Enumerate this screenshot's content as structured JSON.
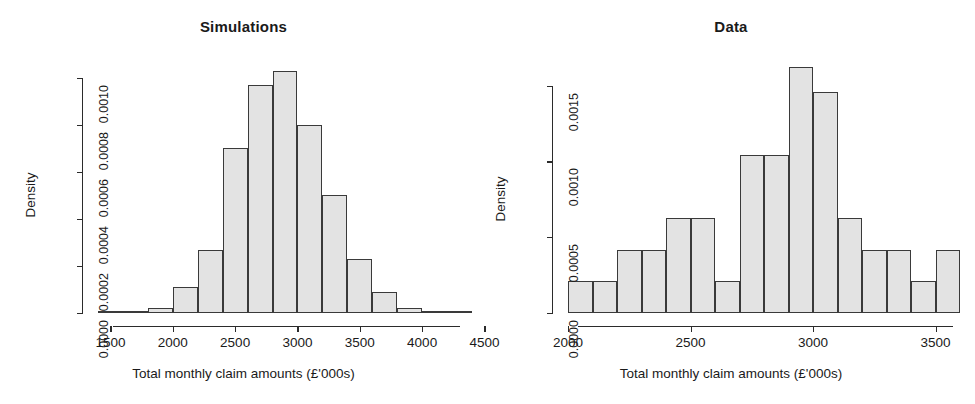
{
  "figure": {
    "background": "#ffffff",
    "bar_fill": "#e3e3e3",
    "bar_stroke": "#3a3a3a",
    "axis_color": "#2b2b2b"
  },
  "panels": [
    {
      "key": "simulations",
      "title": "Simulations",
      "xlabel": "Total monthly claim amounts (£'000s)",
      "ylabel": "Density",
      "xticks": [
        "1500",
        "2000",
        "2500",
        "3000",
        "3500",
        "4000",
        "4500"
      ],
      "yticks": [
        "0.0000",
        "0.0002",
        "0.0004",
        "0.0006",
        "0.0008",
        "0.0010"
      ]
    },
    {
      "key": "data",
      "title": "Data",
      "xlabel": "Total monthly claim amounts (£'000s)",
      "ylabel": "Density",
      "xticks": [
        "2000",
        "2500",
        "3000",
        "3500"
      ],
      "yticks": [
        "0.0000",
        "0.0005",
        "0.0010",
        "0.0015"
      ]
    }
  ],
  "chart_data": [
    {
      "type": "bar",
      "subtype": "histogram",
      "title": "Simulations",
      "xlabel": "Total monthly claim amounts (£'000s)",
      "ylabel": "Density",
      "xlim": [
        1400,
        4400
      ],
      "ylim": [
        0,
        0.00105
      ],
      "xticks": [
        1500,
        2000,
        2500,
        3000,
        3500,
        4000,
        4500
      ],
      "yticks": [
        0.0,
        0.0002,
        0.0004,
        0.0006,
        0.0008,
        0.001
      ],
      "grid": false,
      "legend": null,
      "bin_width": 200,
      "bin_edges": [
        1400,
        1600,
        1800,
        2000,
        2200,
        2400,
        2600,
        2800,
        3000,
        3200,
        3400,
        3600,
        3800,
        4000,
        4200,
        4400
      ],
      "categories": [
        "1400-1600",
        "1600-1800",
        "1800-2000",
        "2000-2200",
        "2200-2400",
        "2400-2600",
        "2600-2800",
        "2800-3000",
        "3000-3200",
        "3200-3400",
        "3400-3600",
        "3600-3800",
        "3800-4000",
        "4000-4200",
        "4200-4400"
      ],
      "values": [
        0.0,
        5e-06,
        2e-05,
        0.00011,
        0.00027,
        0.0007,
        0.00097,
        0.00103,
        0.0008,
        0.0005,
        0.00023,
        9e-05,
        2e-05,
        5e-06,
        0.0
      ]
    },
    {
      "type": "bar",
      "subtype": "histogram",
      "title": "Data",
      "xlabel": "Total monthly claim amounts (£'000s)",
      "ylabel": "Density",
      "xlim": [
        2000,
        3600
      ],
      "ylim": [
        0,
        0.00163
      ],
      "xticks": [
        2000,
        2500,
        3000,
        3500
      ],
      "yticks": [
        0.0,
        0.0005,
        0.001,
        0.0015
      ],
      "grid": false,
      "legend": null,
      "bin_width": 100,
      "bin_edges": [
        2000,
        2100,
        2200,
        2300,
        2400,
        2500,
        2600,
        2700,
        2800,
        2900,
        3000,
        3100,
        3200,
        3300,
        3400,
        3500,
        3600
      ],
      "categories": [
        "2000-2100",
        "2100-2200",
        "2200-2300",
        "2300-2400",
        "2400-2500",
        "2500-2600",
        "2600-2700",
        "2700-2800",
        "2800-2900",
        "2900-3000",
        "3000-3100",
        "3100-3200",
        "3200-3300",
        "3300-3400",
        "3400-3500",
        "3500-3600"
      ],
      "values": [
        0.000208,
        0.000208,
        0.000417,
        0.000417,
        0.000625,
        0.000625,
        0.000208,
        0.001042,
        0.001042,
        0.001625,
        0.001458,
        0.000625,
        0.000417,
        0.000417,
        0.000208,
        0.000417
      ]
    }
  ]
}
